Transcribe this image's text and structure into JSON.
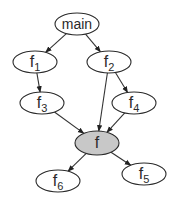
{
  "diagram": {
    "type": "call-graph",
    "colors": {
      "node_fill": "#ffffff",
      "highlight_fill": "#c8c8c8",
      "stroke": "#2a2a2a",
      "edge": "#333333"
    },
    "nodes": [
      {
        "id": "main",
        "base": "main",
        "sub": "",
        "cx": 77,
        "cy": 24,
        "rx": 22,
        "ry": 11,
        "highlight": false
      },
      {
        "id": "f1",
        "base": "f",
        "sub": "1",
        "cx": 35,
        "cy": 62,
        "rx": 22,
        "ry": 11,
        "highlight": false
      },
      {
        "id": "f2",
        "base": "f",
        "sub": "2",
        "cx": 109,
        "cy": 62,
        "rx": 22,
        "ry": 11,
        "highlight": false
      },
      {
        "id": "f3",
        "base": "f",
        "sub": "3",
        "cx": 42,
        "cy": 103,
        "rx": 22,
        "ry": 11,
        "highlight": false
      },
      {
        "id": "f4",
        "base": "f",
        "sub": "4",
        "cx": 134,
        "cy": 103,
        "rx": 22,
        "ry": 11,
        "highlight": false
      },
      {
        "id": "f",
        "base": "f",
        "sub": "",
        "cx": 97,
        "cy": 143,
        "rx": 22,
        "ry": 12,
        "highlight": true
      },
      {
        "id": "f6",
        "base": "f",
        "sub": "6",
        "cx": 58,
        "cy": 181,
        "rx": 22,
        "ry": 11,
        "highlight": false
      },
      {
        "id": "f5",
        "base": "f",
        "sub": "5",
        "cx": 144,
        "cy": 174,
        "rx": 22,
        "ry": 11,
        "highlight": false
      }
    ],
    "edges": [
      {
        "from": "main",
        "to": "f1"
      },
      {
        "from": "main",
        "to": "f2"
      },
      {
        "from": "f1",
        "to": "f3"
      },
      {
        "from": "f2",
        "to": "f4"
      },
      {
        "from": "f2",
        "to": "f"
      },
      {
        "from": "f3",
        "to": "f"
      },
      {
        "from": "f4",
        "to": "f"
      },
      {
        "from": "f",
        "to": "f6"
      },
      {
        "from": "f",
        "to": "f5"
      }
    ]
  }
}
